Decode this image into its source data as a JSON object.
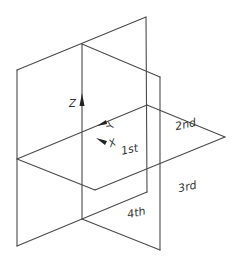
{
  "diagram": {
    "axes": {
      "z": {
        "label": "Z"
      },
      "y": {
        "label": "Y"
      },
      "x": {
        "label": "X"
      }
    },
    "quadrants": [
      {
        "id": "q1",
        "label": "1st"
      },
      {
        "id": "q2",
        "label": "2nd"
      },
      {
        "id": "q3",
        "label": "3rd"
      },
      {
        "id": "q4",
        "label": "4th"
      }
    ],
    "colors": {
      "line": "#4a4a4a",
      "text": "#333333",
      "background": "#ffffff"
    }
  }
}
